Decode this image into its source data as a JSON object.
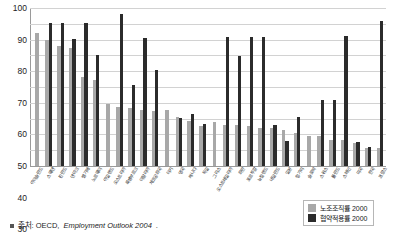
{
  "chart_data": {
    "type": "bar",
    "title": "",
    "subtitle": "",
    "xlabel": "",
    "ylabel": "",
    "ylim": [
      0,
      100
    ],
    "yticks": [
      0,
      10,
      20,
      30,
      40,
      50,
      60,
      70,
      80,
      90,
      100
    ],
    "grid": true,
    "legend_position": "bottom-right",
    "categories": [
      "아이슬란드",
      "스웨덴",
      "핀란드",
      "덴마크",
      "벨기에",
      "노르웨이",
      "아일랜드",
      "오스트리아",
      "룩셈부르크",
      "이탈리아",
      "체코공화국",
      "터키",
      "영국",
      "캐나다",
      "독일",
      "그리스",
      "오스트레일리아",
      "화란",
      "포르투갈",
      "뉴질랜드",
      "네덜란드",
      "일본",
      "헝가리",
      "슬로박",
      "스위스",
      "폴란드",
      "스페인",
      "미국",
      "한국",
      "프랑스"
    ],
    "series": [
      {
        "name": "노조조직률 2000",
        "color": "#a8a8a8",
        "values": [
          84.5,
          79.5,
          76.0,
          74.5,
          56.5,
          54.5,
          39.0,
          37.5,
          36.5,
          35.5,
          35.0,
          35.2,
          31.0,
          28.5,
          25.5,
          28.0,
          26.0,
          26.0,
          25.2,
          24.0,
          24.2,
          23.0,
          21.0,
          19.2,
          19.0,
          16.5,
          16.5,
          14.5,
          11.5,
          11.5
        ]
      },
      {
        "name": "협약적용률 2000",
        "color": "#2b2b2b",
        "values": [
          0,
          90.5,
          90.5,
          80.5,
          90.5,
          70.5,
          0,
          96.0,
          51.0,
          81.0,
          60.5,
          0,
          30.5,
          33.0,
          26.5,
          0,
          81.5,
          69.5,
          81.5,
          81.5,
          26.0,
          16.0,
          31.0,
          0,
          41.5,
          41.5,
          82.0,
          15.5,
          12.0,
          92.0
        ]
      }
    ]
  },
  "legend": {
    "items": [
      {
        "label": "노조조직률 2000",
        "swatch": "density"
      },
      {
        "label": "협약적용률 2000",
        "swatch": "coverage"
      }
    ]
  },
  "source": {
    "bullet": "•",
    "prefix": "출처: OECD, ",
    "emphasis": "Employment Outlook 2004",
    "suffix": "."
  }
}
